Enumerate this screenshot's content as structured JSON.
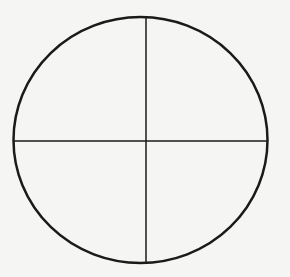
{
  "diagram": {
    "type": "circle-with-crosshair",
    "shapes": {
      "circle": {
        "cx": 140.5,
        "cy": 140,
        "rx": 127,
        "ry": 123,
        "stroke": "#1a1a1a",
        "stroke_width": 2.5
      },
      "horizontal_line": {
        "x1": 13,
        "y1": 141,
        "x2": 268,
        "y2": 141,
        "stroke": "#1a1a1a",
        "stroke_width": 1.5
      },
      "vertical_line": {
        "x1": 146,
        "y1": 17,
        "x2": 146,
        "y2": 263,
        "stroke": "#1a1a1a",
        "stroke_width": 1.5
      }
    },
    "background": "#f5f5f4"
  }
}
